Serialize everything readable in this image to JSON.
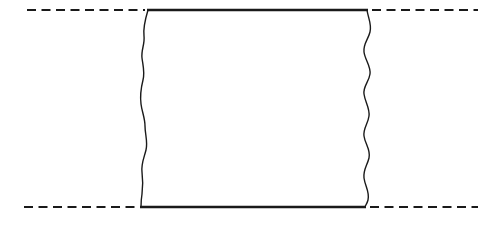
{
  "diagram": {
    "type": "strip-segment-with-wavy-cut-edges",
    "colors": {
      "stroke": "#1a1a1a",
      "background": "#ffffff"
    },
    "top_line": {
      "y": 10,
      "left_dashed": [
        27,
        145
      ],
      "solid": [
        148,
        367
      ],
      "right_dashed": [
        372,
        478
      ]
    },
    "bottom_line": {
      "y": 207,
      "left_dashed": [
        24,
        138
      ],
      "solid": [
        141,
        365
      ],
      "right_dashed": [
        370,
        478
      ]
    },
    "left_wavy_edge": {
      "from": [
        148,
        10
      ],
      "to": [
        141,
        207
      ]
    },
    "right_wavy_edge": {
      "from": [
        367,
        10
      ],
      "to": [
        365,
        207
      ]
    }
  }
}
